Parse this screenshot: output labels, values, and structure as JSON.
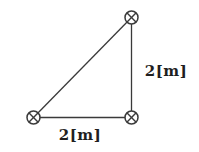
{
  "figure": {
    "background_color": "#ffffff",
    "stroke_color": "#3a3a3a",
    "text_color": "#1f1f1f",
    "symbol_name": "circled-times-icon",
    "symbol_radius": 6.5,
    "vertices": {
      "top": {
        "x": 131.5,
        "y": 17.5
      },
      "bottom_left": {
        "x": 33.5,
        "y": 117.5
      },
      "bottom_right": {
        "x": 131.5,
        "y": 117.5
      }
    },
    "edges": [
      [
        "top",
        "bottom_left"
      ],
      [
        "top",
        "bottom_right"
      ],
      [
        "bottom_left",
        "bottom_right"
      ]
    ],
    "labels": {
      "right_side": {
        "text": "2[m]",
        "x": 166,
        "y": 76
      },
      "bottom_side": {
        "text": "2[m]",
        "x": 80,
        "y": 140
      }
    }
  }
}
